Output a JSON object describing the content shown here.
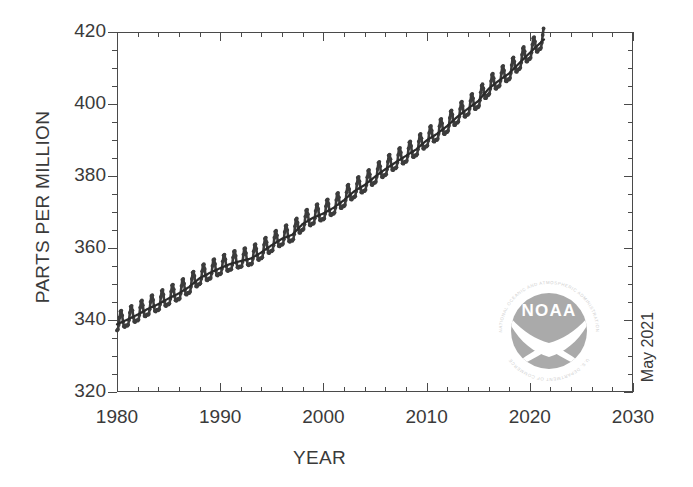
{
  "chart_data": {
    "type": "line",
    "title": "",
    "xlabel": "YEAR",
    "ylabel": "PARTS PER MILLION",
    "xlim": [
      1980,
      2030
    ],
    "ylim": [
      320,
      420
    ],
    "x_ticks": [
      1980,
      1990,
      2000,
      2010,
      2020,
      2030
    ],
    "y_ticks": [
      320,
      340,
      360,
      380,
      400,
      420
    ],
    "x_minor_step": 2,
    "y_minor_step": 5,
    "grid": false,
    "legend": null,
    "series": [
      {
        "name": "Monthly mean CO2",
        "style": "dots-with-seasonal-cycle",
        "color": "#3c3c3c",
        "seasonal_amplitude_ppm": 3.1,
        "x": [
          1980.0,
          1981.0,
          1982.0,
          1983.0,
          1984.0,
          1985.0,
          1986.0,
          1987.0,
          1988.0,
          1989.0,
          1990.0,
          1991.0,
          1992.0,
          1993.0,
          1994.0,
          1995.0,
          1996.0,
          1997.0,
          1998.0,
          1999.0,
          2000.0,
          2001.0,
          2002.0,
          2003.0,
          2004.0,
          2005.0,
          2006.0,
          2007.0,
          2008.0,
          2009.0,
          2010.0,
          2011.0,
          2012.0,
          2013.0,
          2014.0,
          2015.0,
          2016.0,
          2017.0,
          2018.0,
          2019.0,
          2020.0,
          2021.4
        ],
        "values": [
          338.8,
          340.1,
          341.5,
          343.1,
          344.4,
          346.0,
          347.4,
          349.2,
          351.6,
          353.1,
          354.4,
          355.6,
          356.4,
          357.1,
          358.8,
          360.8,
          362.6,
          363.7,
          366.7,
          368.4,
          369.6,
          371.2,
          373.3,
          375.8,
          377.5,
          379.8,
          381.9,
          383.8,
          385.6,
          387.4,
          389.9,
          391.7,
          393.9,
          396.5,
          398.7,
          400.8,
          404.2,
          406.5,
          408.5,
          411.4,
          414.2,
          418.0
        ]
      },
      {
        "name": "Seasonally corrected trend",
        "style": "smooth-line",
        "color": "#2a2a2a",
        "x": [
          1980.0,
          1985.0,
          1990.0,
          1995.0,
          2000.0,
          2005.0,
          2010.0,
          2015.0,
          2020.0,
          2021.4
        ],
        "values": [
          338.8,
          346.0,
          354.4,
          360.8,
          369.6,
          379.8,
          389.9,
          400.8,
          414.2,
          418.0
        ]
      }
    ],
    "annotations": [
      {
        "name": "date-stamp",
        "text": "May 2021",
        "rotation": -90,
        "position": "right-axis-bottom"
      },
      {
        "name": "noaa-logo",
        "text": "NOAA",
        "position": "lower-right-inside-plot"
      }
    ]
  },
  "axes": {
    "y_title": "PARTS PER MILLION",
    "x_title": "YEAR",
    "y_tick_labels": [
      "420",
      "400",
      "380",
      "360",
      "340",
      "320"
    ],
    "x_tick_labels": [
      "1980",
      "1990",
      "2000",
      "2010",
      "2020",
      "2030"
    ]
  },
  "logo": {
    "name": "noaa-logo",
    "wordmark": "NOAA",
    "ring_text_top": "NATIONAL OCEANIC AND ATMOSPHERIC ADMINISTRATION",
    "ring_text_bottom": "U.S. DEPARTMENT OF COMMERCE",
    "color": "#a8a8a8"
  },
  "date_stamp": {
    "text": "May 2021"
  },
  "colors": {
    "axis": "#4a4a4a",
    "data": "#3c3c3c",
    "text": "#3a3a3a",
    "logo": "#a8a8a8",
    "background": "#ffffff"
  }
}
